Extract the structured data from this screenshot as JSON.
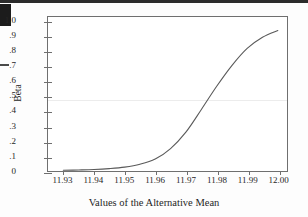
{
  "figure": {
    "background_color": "#fdfdfd",
    "plot_background_color": "#ffffff",
    "frame_color": "#6f6f6f",
    "curve_color": "#5a5a5a",
    "gridline_color": "#ececec",
    "text_color": "#262626"
  },
  "artifacts": {
    "corner_block_name": "scan-corner-block",
    "left_dash_name": "scan-left-dash",
    "top_edge_name": "scan-page-top-edge"
  },
  "chart_data": {
    "type": "line",
    "title": "",
    "xlabel": "Values of the Alternative Mean",
    "ylabel": "Beta",
    "xlim": [
      11.925,
      12.003
    ],
    "ylim": [
      0.0,
      1.03
    ],
    "grid": true,
    "gridlines_y": [
      0.48
    ],
    "legend": null,
    "xticks": [
      11.93,
      11.94,
      11.95,
      11.96,
      11.97,
      11.98,
      11.99,
      12.0
    ],
    "xticklabels": [
      "11.93",
      "11.94",
      "11.95",
      "11.96",
      "11.97",
      "11.98",
      "11.99",
      "12.00"
    ],
    "yticks": [
      0,
      0.1,
      0.2,
      0.3,
      0.4,
      0.5,
      0.6,
      0.7,
      0.8,
      0.9,
      1.0
    ],
    "yticklabels": [
      "0",
      ".1",
      ".2",
      ".3",
      ".4",
      ".5",
      ".6",
      ".7",
      ".8",
      ".9",
      "1.0"
    ],
    "series": [
      {
        "name": "Beta",
        "x": [
          11.93,
          11.935,
          11.94,
          11.945,
          11.95,
          11.955,
          11.96,
          11.965,
          11.97,
          11.975,
          11.98,
          11.985,
          11.99,
          11.995,
          12.0
        ],
        "values": [
          0.005,
          0.007,
          0.01,
          0.016,
          0.026,
          0.045,
          0.08,
          0.15,
          0.26,
          0.41,
          0.565,
          0.705,
          0.82,
          0.895,
          0.94
        ]
      }
    ]
  }
}
